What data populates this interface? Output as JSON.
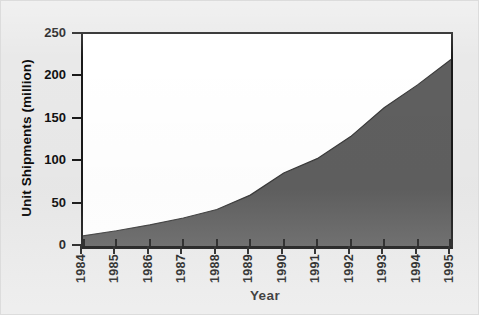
{
  "chart_data": {
    "type": "area",
    "title": "",
    "xlabel": "Year",
    "ylabel": "Unit Shipments (million)",
    "categories": [
      "1984",
      "1985",
      "1986",
      "1987",
      "1988",
      "1989",
      "1990",
      "1991",
      "1992",
      "1993",
      "1994",
      "1995"
    ],
    "values": [
      12,
      18,
      25,
      33,
      43,
      60,
      86,
      103,
      129,
      163,
      190,
      220
    ],
    "x": [
      1984,
      1985,
      1986,
      1987,
      1988,
      1989,
      1990,
      1991,
      1992,
      1993,
      1994,
      1995
    ],
    "series": [
      {
        "name": "Unit Shipments",
        "values": [
          12,
          18,
          25,
          33,
          43,
          60,
          86,
          103,
          129,
          163,
          190,
          220
        ]
      }
    ],
    "ylim": [
      0,
      250
    ],
    "xlim": [
      1984,
      1995
    ],
    "yticks": [
      0,
      50,
      100,
      150,
      200,
      250
    ],
    "ytick_labels": [
      "0",
      "50",
      "100",
      "150",
      "200",
      "250"
    ],
    "xticks": [
      1984,
      1985,
      1986,
      1987,
      1988,
      1989,
      1990,
      1991,
      1992,
      1993,
      1994,
      1995
    ],
    "xtick_labels": [
      "1984",
      "1985",
      "1986",
      "1987",
      "1988",
      "1989",
      "1990",
      "1991",
      "1992",
      "1993",
      "1994",
      "1995"
    ],
    "grid": false,
    "legend": false,
    "legend_position": "none",
    "xtick_rotation": 90,
    "colors": {
      "area_fill": "#5f5f5f",
      "area_line": "#3a3a3a",
      "plot_background": "#ffffff",
      "figure_background": "#e9e9e9",
      "axis": "#1a1a1a",
      "text": "#111111"
    }
  },
  "axes": {
    "y_title": "Unit Shipments (million)",
    "x_title": "Year",
    "y_ticks": [
      {
        "label": "250",
        "value": 250
      },
      {
        "label": "200",
        "value": 200
      },
      {
        "label": "150",
        "value": 150
      },
      {
        "label": "100",
        "value": 100
      },
      {
        "label": "50",
        "value": 50
      },
      {
        "label": "0",
        "value": 0
      }
    ],
    "x_ticks": [
      {
        "label": "1984"
      },
      {
        "label": "1985"
      },
      {
        "label": "1986"
      },
      {
        "label": "1987"
      },
      {
        "label": "1988"
      },
      {
        "label": "1989"
      },
      {
        "label": "1990"
      },
      {
        "label": "1991"
      },
      {
        "label": "1992"
      },
      {
        "label": "1993"
      },
      {
        "label": "1994"
      },
      {
        "label": "1995"
      }
    ]
  }
}
